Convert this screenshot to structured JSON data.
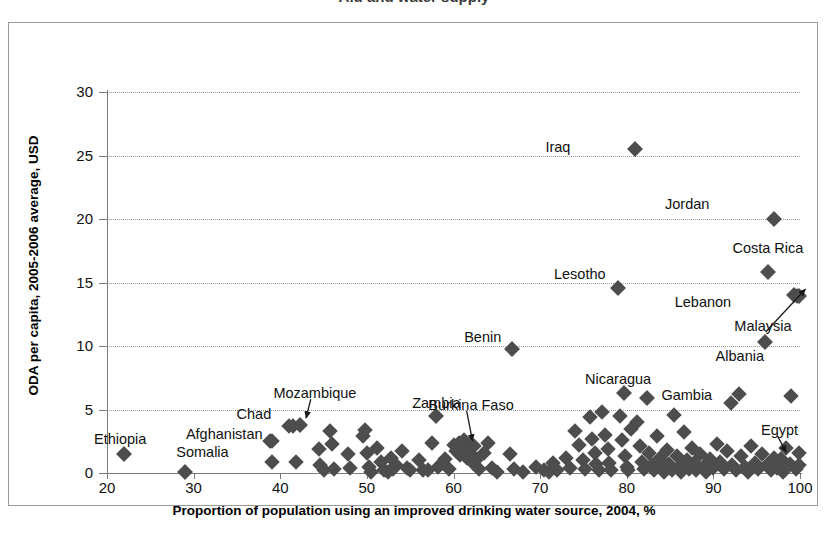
{
  "title_fragment": "Aid and water supply",
  "chart_data": {
    "type": "scatter",
    "title": "",
    "xlabel": "Proportion of population using an improved drinking water source, 2004,  %",
    "ylabel": "ODA per capita, 2005-2006 average, USD",
    "xlim": [
      20,
      100
    ],
    "ylim": [
      0,
      30
    ],
    "xticks": [
      20,
      30,
      40,
      50,
      60,
      70,
      80,
      90,
      100
    ],
    "yticks": [
      0,
      5,
      10,
      15,
      20,
      25,
      30
    ],
    "grid": "horizontal-dotted",
    "legend": "none",
    "marker": "diamond",
    "marker_color": "#4d4d4d",
    "labeled_points": [
      {
        "label": "Iraq",
        "x": 81.0,
        "y": 25.5,
        "lx": 73.5,
        "ly": 25.6,
        "anchor": "end",
        "leader": false
      },
      {
        "label": "Jordan",
        "x": 97.0,
        "y": 20.0,
        "lx": 89.5,
        "ly": 21.1,
        "anchor": "end",
        "leader": false
      },
      {
        "label": "Costa Rica",
        "x": 96.3,
        "y": 15.8,
        "lx": 96.3,
        "ly": 17.6,
        "anchor": "mid",
        "leader": false
      },
      {
        "label": "Lebanon",
        "x": 99.3,
        "y": 14.0,
        "lx": 92.0,
        "ly": 13.4,
        "anchor": "end",
        "leader": false
      },
      {
        "label": "Malaysia",
        "x": 99.9,
        "y": 13.9,
        "lx": 99.0,
        "ly": 11.5,
        "anchor": "end",
        "leader": true
      },
      {
        "label": "Albania",
        "x": 96.0,
        "y": 10.3,
        "lx": 95.8,
        "ly": 9.1,
        "anchor": "end",
        "leader": false
      },
      {
        "label": "Lesotho",
        "x": 79.0,
        "y": 14.6,
        "lx": 77.6,
        "ly": 15.6,
        "anchor": "end",
        "leader": false
      },
      {
        "label": "Benin",
        "x": 66.8,
        "y": 9.8,
        "lx": 65.5,
        "ly": 10.6,
        "anchor": "end",
        "leader": false
      },
      {
        "label": "Nicaragua",
        "x": 79.7,
        "y": 6.3,
        "lx": 79.0,
        "ly": 7.3,
        "anchor": "mid",
        "leader": false
      },
      {
        "label": "Gambia",
        "x": 82.3,
        "y": 5.9,
        "lx": 84.0,
        "ly": 6.1,
        "anchor": "start",
        "leader": false
      },
      {
        "label": "Zambia",
        "x": 58.0,
        "y": 4.5,
        "lx": 58.0,
        "ly": 5.4,
        "anchor": "mid",
        "leader": false
      },
      {
        "label": "Mozambique",
        "x": 42.3,
        "y": 3.8,
        "lx": 44.0,
        "ly": 6.2,
        "anchor": "mid",
        "leader": true
      },
      {
        "label": "Burkina Faso",
        "x": 61.5,
        "y": 2.0,
        "lx": 62.0,
        "ly": 5.3,
        "anchor": "mid",
        "leader": true
      },
      {
        "label": "Chad",
        "x": 41.5,
        "y": 3.7,
        "lx": 39.0,
        "ly": 4.6,
        "anchor": "end",
        "leader": false
      },
      {
        "label": "Afghanistan",
        "x": 39.0,
        "y": 2.5,
        "lx": 38.0,
        "ly": 3.0,
        "anchor": "end",
        "leader": false
      },
      {
        "label": "Somalia",
        "x": 29.0,
        "y": 0.1,
        "lx": 34.0,
        "ly": 1.6,
        "anchor": "end",
        "leader": false
      },
      {
        "label": "Ethiopia",
        "x": 22.0,
        "y": 1.5,
        "lx": 24.5,
        "ly": 2.6,
        "anchor": "end",
        "leader": false
      },
      {
        "label": "Egypt",
        "x": 97.8,
        "y": 1.1,
        "lx": 95.5,
        "ly": 3.3,
        "anchor": "start",
        "leader": true
      }
    ],
    "points": [
      [
        22.0,
        1.5
      ],
      [
        29.0,
        0.1
      ],
      [
        38.8,
        2.5
      ],
      [
        39.0,
        0.9
      ],
      [
        41.0,
        3.7
      ],
      [
        42.3,
        3.8
      ],
      [
        41.8,
        0.9
      ],
      [
        44.5,
        1.9
      ],
      [
        44.6,
        0.6
      ],
      [
        45.8,
        3.3
      ],
      [
        46.0,
        2.3
      ],
      [
        46.2,
        0.3
      ],
      [
        47.8,
        1.5
      ],
      [
        48.0,
        0.4
      ],
      [
        49.5,
        2.9
      ],
      [
        49.8,
        3.4
      ],
      [
        50.0,
        1.6
      ],
      [
        50.2,
        0.5
      ],
      [
        51.2,
        2.0
      ],
      [
        51.6,
        0.9
      ],
      [
        52.0,
        0.2
      ],
      [
        52.4,
        0.1
      ],
      [
        52.8,
        1.2
      ],
      [
        53.0,
        0.3
      ],
      [
        53.4,
        0.6
      ],
      [
        54.0,
        1.7
      ],
      [
        54.6,
        0.4
      ],
      [
        55.0,
        0.2
      ],
      [
        56.0,
        1.0
      ],
      [
        56.5,
        0.2
      ],
      [
        57.5,
        2.4
      ],
      [
        58.0,
        4.5
      ],
      [
        58.2,
        0.5
      ],
      [
        59.0,
        1.1
      ],
      [
        59.5,
        0.3
      ],
      [
        60.0,
        2.2
      ],
      [
        60.3,
        1.7
      ],
      [
        60.6,
        2.4
      ],
      [
        60.8,
        1.4
      ],
      [
        61.0,
        2.0
      ],
      [
        61.2,
        2.6
      ],
      [
        61.4,
        1.8
      ],
      [
        61.5,
        2.0
      ],
      [
        61.6,
        1.2
      ],
      [
        61.8,
        2.3
      ],
      [
        62.0,
        1.5
      ],
      [
        62.2,
        0.8
      ],
      [
        62.4,
        2.1
      ],
      [
        62.6,
        1.0
      ],
      [
        63.0,
        0.3
      ],
      [
        63.5,
        1.6
      ],
      [
        64.0,
        2.4
      ],
      [
        64.5,
        0.4
      ],
      [
        66.8,
        9.8
      ],
      [
        66.5,
        1.5
      ],
      [
        67.0,
        0.3
      ],
      [
        69.5,
        0.5
      ],
      [
        70.5,
        0.2
      ],
      [
        71.5,
        0.8
      ],
      [
        72.0,
        0.2
      ],
      [
        73.0,
        1.2
      ],
      [
        73.5,
        0.4
      ],
      [
        74.0,
        3.3
      ],
      [
        74.5,
        2.2
      ],
      [
        75.0,
        1.0
      ],
      [
        75.2,
        0.3
      ],
      [
        75.8,
        4.4
      ],
      [
        76.0,
        2.7
      ],
      [
        76.3,
        1.6
      ],
      [
        76.5,
        0.7
      ],
      [
        76.8,
        0.2
      ],
      [
        77.2,
        4.8
      ],
      [
        77.5,
        3.0
      ],
      [
        77.8,
        1.9
      ],
      [
        78.0,
        0.8
      ],
      [
        78.2,
        0.2
      ],
      [
        79.0,
        14.6
      ],
      [
        79.7,
        6.3
      ],
      [
        79.2,
        4.5
      ],
      [
        79.5,
        2.6
      ],
      [
        79.8,
        1.3
      ],
      [
        80.0,
        0.5
      ],
      [
        80.2,
        0.2
      ],
      [
        80.5,
        3.5
      ],
      [
        81.0,
        25.5
      ],
      [
        81.2,
        4.0
      ],
      [
        81.5,
        2.1
      ],
      [
        81.8,
        0.9
      ],
      [
        82.0,
        0.3
      ],
      [
        82.3,
        5.9
      ],
      [
        82.6,
        1.6
      ],
      [
        82.9,
        0.6
      ],
      [
        83.2,
        0.2
      ],
      [
        83.5,
        2.9
      ],
      [
        83.8,
        1.2
      ],
      [
        84.0,
        0.4
      ],
      [
        84.3,
        0.1
      ],
      [
        84.6,
        1.8
      ],
      [
        84.9,
        0.7
      ],
      [
        85.2,
        0.2
      ],
      [
        85.5,
        4.6
      ],
      [
        85.8,
        1.3
      ],
      [
        86.0,
        0.5
      ],
      [
        86.3,
        0.1
      ],
      [
        86.6,
        3.2
      ],
      [
        86.9,
        1.0
      ],
      [
        87.2,
        0.3
      ],
      [
        87.5,
        2.0
      ],
      [
        87.8,
        0.8
      ],
      [
        88.0,
        0.2
      ],
      [
        88.4,
        1.5
      ],
      [
        88.8,
        0.5
      ],
      [
        89.2,
        0.1
      ],
      [
        89.6,
        1.1
      ],
      [
        90.0,
        0.4
      ],
      [
        90.4,
        2.3
      ],
      [
        90.8,
        0.9
      ],
      [
        91.2,
        0.3
      ],
      [
        91.6,
        1.7
      ],
      [
        92.0,
        5.5
      ],
      [
        92.2,
        0.6
      ],
      [
        92.6,
        0.2
      ],
      [
        93.0,
        6.2
      ],
      [
        93.2,
        1.3
      ],
      [
        93.6,
        0.5
      ],
      [
        94.0,
        0.1
      ],
      [
        94.4,
        2.1
      ],
      [
        94.8,
        0.8
      ],
      [
        95.2,
        0.3
      ],
      [
        95.6,
        1.5
      ],
      [
        96.0,
        10.3
      ],
      [
        96.3,
        15.8
      ],
      [
        96.2,
        0.6
      ],
      [
        96.6,
        0.2
      ],
      [
        97.0,
        20.0
      ],
      [
        97.0,
        1.2
      ],
      [
        97.4,
        0.4
      ],
      [
        97.8,
        1.1
      ],
      [
        98.0,
        0.1
      ],
      [
        98.4,
        2.0
      ],
      [
        98.8,
        0.7
      ],
      [
        99.0,
        6.1
      ],
      [
        99.3,
        14.0
      ],
      [
        99.6,
        13.9
      ],
      [
        99.9,
        13.9
      ],
      [
        99.5,
        0.3
      ],
      [
        99.9,
        1.6
      ],
      [
        99.9,
        0.6
      ],
      [
        45.0,
        0.2
      ],
      [
        50.5,
        0.1
      ],
      [
        57.0,
        0.2
      ],
      [
        65.0,
        0.1
      ],
      [
        68.0,
        0.1
      ],
      [
        71.0,
        0.1
      ]
    ]
  }
}
